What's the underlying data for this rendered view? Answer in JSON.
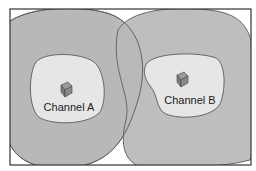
{
  "diagram": {
    "type": "wireless coverage diagram",
    "colors": {
      "outer_coverage": "#b8b8b8",
      "inner_coverage": "#e6e6e6",
      "outline": "#666666",
      "frame": "#333333",
      "ap_icon": "#8a8a8a"
    },
    "cells": [
      {
        "id": "A",
        "label": "Channel A",
        "icon": "access-point-cube-icon"
      },
      {
        "id": "B",
        "label": "Channel B",
        "icon": "access-point-cube-icon"
      }
    ]
  }
}
